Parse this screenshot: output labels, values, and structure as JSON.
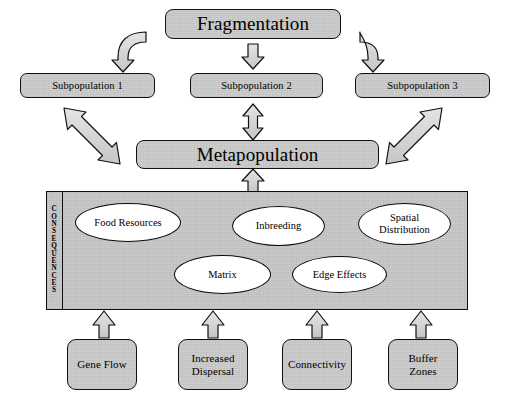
{
  "diagram": {
    "title_node": {
      "label": "Fragmentation"
    },
    "metapopulation_node": {
      "label": "Metapopulation"
    },
    "subpopulations": [
      {
        "label": "Subpopulation 1"
      },
      {
        "label": "Subpopulation 2"
      },
      {
        "label": "Subpopulation 3"
      }
    ],
    "consequences_panel": {
      "sidebar_label": "C\nO\nN\nS\nE\nQ\nU\nE\nN\nC\nE\nS",
      "nodes": [
        {
          "id": "food-resources",
          "label": "Food Resources"
        },
        {
          "id": "inbreeding",
          "label": "Inbreeding"
        },
        {
          "id": "spatial-distribution",
          "label": "Spatial\nDistribution"
        },
        {
          "id": "matrix",
          "label": "Matrix"
        },
        {
          "id": "edge-effects",
          "label": "Edge Effects"
        }
      ],
      "links": [
        {
          "from": "food-resources",
          "to": "matrix"
        },
        {
          "from": "matrix",
          "to": "inbreeding"
        },
        {
          "from": "inbreeding",
          "to": "spatial-distribution"
        },
        {
          "from": "inbreeding",
          "to": "edge-effects"
        },
        {
          "from": "matrix",
          "to": "edge-effects"
        },
        {
          "from": "edge-effects",
          "to": "spatial-distribution"
        }
      ]
    },
    "drivers": [
      {
        "label": "Gene Flow"
      },
      {
        "label": "Increased\nDispersal"
      },
      {
        "label": "Connectivity"
      },
      {
        "label": "Buffer\nZones"
      }
    ],
    "arrows": [
      {
        "id": "fragmentation-to-subpopulation-1",
        "kind": "curved-down-left"
      },
      {
        "id": "fragmentation-to-subpopulation-2",
        "kind": "straight-down"
      },
      {
        "id": "fragmentation-to-subpopulation-3",
        "kind": "curved-down-right"
      },
      {
        "id": "subpopulation-1-metapopulation",
        "kind": "double-diagonal"
      },
      {
        "id": "subpopulation-2-metapopulation",
        "kind": "double-vertical"
      },
      {
        "id": "subpopulation-3-metapopulation",
        "kind": "double-diagonal"
      },
      {
        "id": "consequences-to-metapopulation",
        "kind": "straight-up"
      },
      {
        "id": "gene-flow-to-consequences",
        "kind": "straight-up"
      },
      {
        "id": "increased-dispersal-to-consequences",
        "kind": "straight-up"
      },
      {
        "id": "connectivity-to-consequences",
        "kind": "straight-up"
      },
      {
        "id": "buffer-zones-to-consequences",
        "kind": "straight-up"
      }
    ],
    "colors": {
      "box_fill": "#cfcfcf",
      "panel_fill": "#cbcbcb",
      "ellipse_fill": "#ffffff",
      "stroke": "#111111",
      "arrow_fill": "#d3d3d3",
      "background": "#ffffff"
    }
  }
}
